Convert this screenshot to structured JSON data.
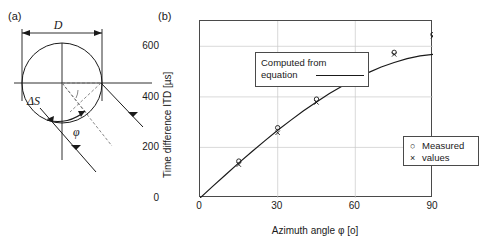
{
  "panel_a": {
    "label": "(a)",
    "diameter_label": "D",
    "arc_label": "ΔS",
    "angle_label": "φ",
    "icon_names": [
      "head-circle",
      "diameter-arrow",
      "sound-ray-arrow",
      "angle-arc"
    ]
  },
  "panel_b": {
    "label": "(b)",
    "legend_computed": {
      "line1": "Computed from",
      "line2": "equation"
    },
    "legend_measured": {
      "line1": "Measured",
      "line2": "values",
      "marker_circle": "○",
      "marker_cross": "×"
    }
  },
  "chart_data": {
    "type": "line",
    "title": "",
    "xlabel": "Azimuth angle φ [o]",
    "ylabel": "Time difference ITD [µs]",
    "xlim": [
      0,
      90
    ],
    "ylim": [
      0,
      700
    ],
    "xticks": [
      0,
      30,
      60,
      90
    ],
    "xtick_labels": [
      "0",
      "30",
      "60",
      "90"
    ],
    "yticks": [
      0,
      200,
      400,
      600
    ],
    "ytick_labels": [
      "0",
      "200",
      "400",
      "600"
    ],
    "grid": true,
    "legend_position": "inside",
    "series": [
      {
        "name": "Computed from equation",
        "type": "line",
        "x": [
          0,
          5,
          10,
          15,
          20,
          25,
          30,
          35,
          40,
          45,
          50,
          55,
          60,
          65,
          70,
          75,
          80,
          85,
          90
        ],
        "y": [
          0,
          47,
          93,
          139,
          183,
          226,
          268,
          307,
          345,
          380,
          413,
          443,
          471,
          496,
          518,
          536,
          551,
          562,
          568
        ]
      },
      {
        "name": "Measured values (circle)",
        "type": "scatter",
        "marker": "circle",
        "x": [
          15,
          30,
          45,
          60,
          75,
          90
        ],
        "y": [
          146,
          278,
          391,
          486,
          576,
          646
        ]
      },
      {
        "name": "Measured values (cross)",
        "type": "scatter",
        "marker": "cross",
        "x": [
          15,
          30,
          45,
          60,
          75,
          90
        ],
        "y": [
          132,
          258,
          378,
          478,
          568,
          640
        ]
      }
    ]
  }
}
